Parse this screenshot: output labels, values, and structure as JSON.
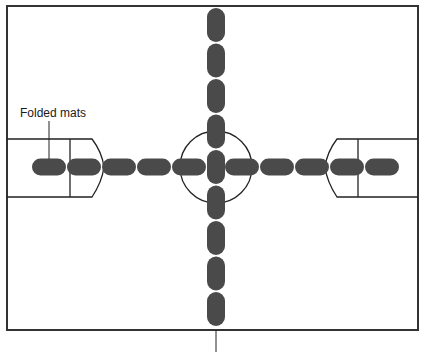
{
  "diagram": {
    "annotations": {
      "folded_mats_label": "Folded mats"
    },
    "colors": {
      "mat": "#4a4a4a",
      "lines": "#222222",
      "background": "#ffffff"
    },
    "mats": {
      "horizontal_row_left_count": 5,
      "horizontal_row_right_count": 5,
      "vertical_column_count": 9
    }
  }
}
